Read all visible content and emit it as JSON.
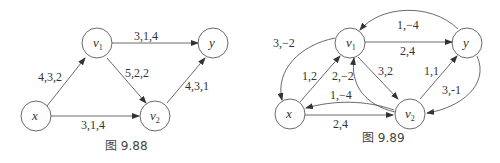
{
  "figures": [
    {
      "caption": "图 9.88",
      "nodes": {
        "x": "x",
        "v1": "v1",
        "v2": "v2",
        "y": "y"
      },
      "edges": [
        {
          "from": "x",
          "to": "v1",
          "label": "4,3,2"
        },
        {
          "from": "v1",
          "to": "y",
          "label": "3,1,4"
        },
        {
          "from": "v1",
          "to": "v2",
          "label": "5,2,2"
        },
        {
          "from": "v2",
          "to": "y",
          "label": "4,3,1"
        },
        {
          "from": "x",
          "to": "v2",
          "label": "3,1,4"
        }
      ]
    },
    {
      "caption": "图 9.89",
      "nodes": {
        "x": "x",
        "v1": "v1",
        "v2": "v2",
        "y": "y"
      },
      "edges": [
        {
          "from": "y",
          "to": "v1",
          "label": "1,−4"
        },
        {
          "from": "v1",
          "to": "x",
          "label": "3,−2"
        },
        {
          "from": "v1",
          "to": "y",
          "label": "2,4"
        },
        {
          "from": "x",
          "to": "v1",
          "label": "1,2"
        },
        {
          "from": "v2",
          "to": "v1",
          "label": "2,−2"
        },
        {
          "from": "v1",
          "to": "v2",
          "label": "3,2"
        },
        {
          "from": "v2",
          "to": "y",
          "label": "1,1"
        },
        {
          "from": "y",
          "to": "v2",
          "label": "3,-1"
        },
        {
          "from": "v2",
          "to": "x",
          "label": "1,−4"
        },
        {
          "from": "x",
          "to": "v2",
          "label": "2,4"
        }
      ]
    }
  ]
}
